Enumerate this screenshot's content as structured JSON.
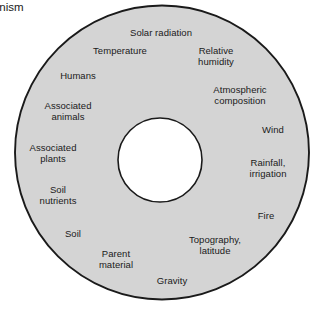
{
  "figure": {
    "kind": "concentric-circle-diagram",
    "background_color": "#ffffff",
    "ring_fill_color": "#d4d4d4",
    "ring_stroke_color": "#1a1a1a",
    "core_fill_color": "#ffffff",
    "text_color": "#1a1a1a"
  },
  "core": {
    "label": "Crop\norganism"
  },
  "ring": {
    "labels": [
      {
        "text": "Solar radiation",
        "x": 161,
        "y": 33
      },
      {
        "text": "Temperature",
        "x": 120,
        "y": 51
      },
      {
        "text": "Relative\nhumidity",
        "x": 216,
        "y": 56
      },
      {
        "text": "Humans",
        "x": 78,
        "y": 76
      },
      {
        "text": "Atmospheric\ncomposition",
        "x": 240,
        "y": 95
      },
      {
        "text": "Associated\nanimals",
        "x": 68,
        "y": 111
      },
      {
        "text": "Wind",
        "x": 273,
        "y": 130
      },
      {
        "text": "Associated\nplants",
        "x": 53,
        "y": 153
      },
      {
        "text": "Rainfall,\nirrigation",
        "x": 268,
        "y": 168
      },
      {
        "text": "Soil\nnutrients",
        "x": 58,
        "y": 195
      },
      {
        "text": "Fire",
        "x": 266,
        "y": 216
      },
      {
        "text": "Soil",
        "x": 73,
        "y": 234
      },
      {
        "text": "Topography,\nlatitude",
        "x": 215,
        "y": 245
      },
      {
        "text": "Parent\nmaterial",
        "x": 116,
        "y": 259
      },
      {
        "text": "Gravity",
        "x": 172,
        "y": 281
      }
    ]
  }
}
